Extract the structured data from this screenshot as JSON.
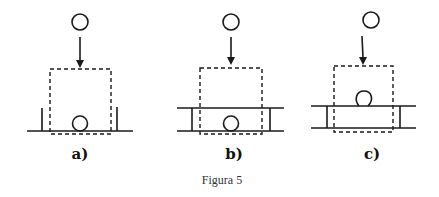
{
  "figure": {
    "caption": "Figura 5",
    "stroke_color": "#1a1a1a",
    "panels": [
      {
        "id": "a",
        "label": "a)",
        "description": "Falling circle into dashed box; single baseline with two short vertical posts; circle resting on baseline"
      },
      {
        "id": "b",
        "label": "b)",
        "description": "Falling circle into dashed box; two horizontal lines joined by vertical sides forming a channel; circle resting on bottom line"
      },
      {
        "id": "c",
        "label": "c)",
        "description": "Falling circle into dashed box; two horizontal lines joined by vertical sides; circle resting on top line"
      }
    ]
  }
}
